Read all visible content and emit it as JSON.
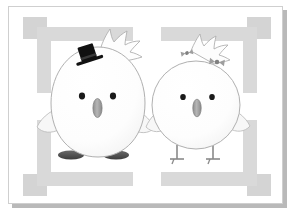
{
  "image": {
    "kind": "illustration",
    "subject": "wedding chicks greeting card",
    "alt": "Two cartoon baby chicks standing side by side holding wings, the left wearing a black top hat and the right wearing two gray hair bows, on a white card with a gray geometric border",
    "width": 292,
    "height": 213
  },
  "card": {
    "background_color": "#ffffff",
    "border_color": "#cfcfcf",
    "shadow_color": "#b9b9b9"
  },
  "frame": {
    "name": "geometric-border",
    "band_color": "#d9d9d9",
    "corner_color": "#d4d4d4",
    "inner_plate_color": "#ffffff",
    "description": "Nested square frame of light gray bands with four solid corner squares and gaps at the middle of each side"
  },
  "palette": {
    "body_fill": "#fdfdfd",
    "body_outline": "#b0b0b0",
    "eye_color": "#1a1a1a",
    "beak_fill": "#9a9a9a",
    "beak_outline": "#7d7d7d",
    "hat_color": "#111111",
    "bow_color": "#9e9e9e",
    "foot_dark": "#4a4a4a",
    "leg_color": "#8a8a8a",
    "wing_fill": "#f6f6f6",
    "wing_outline": "#bdbdbd"
  },
  "characters": [
    {
      "id": "groom-chick",
      "label": "Groom chick",
      "position": "left",
      "accessory": "black top hat",
      "accessory_color": "#111111",
      "body_shape": "large egg",
      "feet_style": "flat dark oval feet",
      "eyes": 2,
      "crest_spikes": 4,
      "wings": 2
    },
    {
      "id": "bride-chick",
      "label": "Bride chick",
      "position": "right",
      "accessory": "two gray hair bows",
      "accessory_color": "#9e9e9e",
      "body_shape": "round circle",
      "feet_style": "thin stick legs with small feet",
      "eyes": 2,
      "crest_spikes": 4,
      "wings": 2
    }
  ],
  "details": {
    "hands_held": true,
    "contact_point": "center overlapping wings",
    "text_content": "",
    "caption": ""
  }
}
